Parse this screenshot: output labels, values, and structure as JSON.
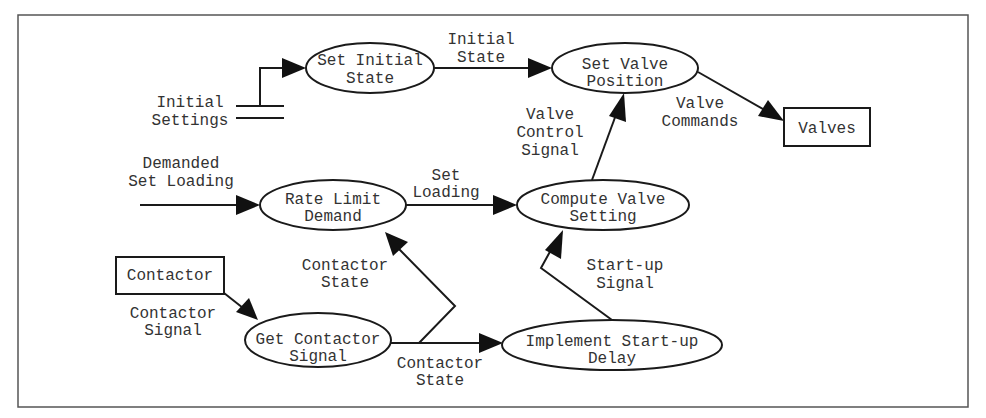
{
  "diagram": {
    "type": "data-flow-diagram",
    "processes": {
      "set_initial_state": [
        "Set Initial",
        "State"
      ],
      "set_valve_position": [
        "Set Valve",
        "Position"
      ],
      "rate_limit_demand": [
        "Rate Limit",
        "Demand"
      ],
      "compute_valve_setting": [
        "Compute Valve",
        "Setting"
      ],
      "get_contactor_signal": [
        "Get Contactor",
        "Signal"
      ],
      "implement_startup_delay": [
        "Implement Start-up",
        "Delay"
      ]
    },
    "externals": {
      "valves": "Valves",
      "contactor": "Contactor"
    },
    "data_store": {
      "initial_settings": [
        "Initial",
        "Settings"
      ]
    },
    "flows": {
      "initial_state": [
        "Initial",
        "State"
      ],
      "valve_commands": [
        "Valve",
        "Commands"
      ],
      "valve_control_signal": [
        "Valve",
        "Control",
        "Signal"
      ],
      "demanded_set_loading": [
        "Demanded",
        "Set Loading"
      ],
      "set_loading": [
        "Set",
        "Loading"
      ],
      "contactor_state_up": [
        "Contactor",
        "State"
      ],
      "startup_signal": [
        "Start-up",
        "Signal"
      ],
      "contactor_signal": [
        "Contactor",
        "Signal"
      ],
      "contactor_state_right": [
        "Contactor",
        "State"
      ]
    }
  }
}
